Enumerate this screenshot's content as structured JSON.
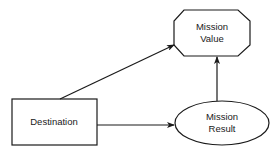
{
  "nodes": {
    "mission_value": {
      "line1": "Mission",
      "line2": "Value",
      "shape": "octagon"
    },
    "destination": {
      "label": "Destination",
      "shape": "rectangle"
    },
    "mission_result": {
      "line1": "Mission",
      "line2": "Result",
      "shape": "ellipse"
    }
  },
  "edges": [
    {
      "from": "Destination",
      "to": "Mission Value"
    },
    {
      "from": "Destination",
      "to": "Mission Result"
    },
    {
      "from": "Mission Result",
      "to": "Mission Value"
    }
  ],
  "colors": {
    "stroke": "#1a1a1a",
    "background": "#ffffff"
  }
}
